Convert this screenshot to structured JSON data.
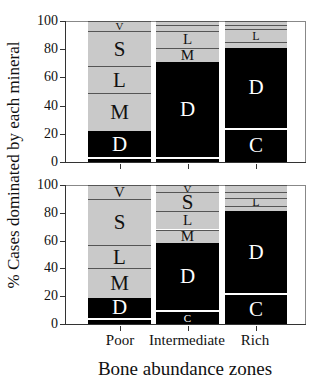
{
  "chart_data": [
    {
      "type": "bar",
      "stacked": true,
      "panel": "top",
      "categories": [
        "Poor",
        "Intermediate",
        "Rich"
      ],
      "ylabel": "% Cases dominated by each mineral",
      "xlabel": "Bone abundance zones",
      "ylim": [
        0,
        100
      ],
      "yticks": [
        0,
        20,
        40,
        60,
        80,
        100
      ],
      "segments_order": [
        "C",
        "D",
        "M",
        "L",
        "S",
        "V"
      ],
      "series": [
        {
          "name": "C",
          "values": [
            2,
            2,
            23
          ],
          "color": "#000000"
        },
        {
          "name": "D",
          "values": [
            20,
            69,
            58
          ],
          "color": "#000000"
        },
        {
          "name": "M",
          "values": [
            27,
            10,
            4
          ],
          "color": "#c9c9c9"
        },
        {
          "name": "L",
          "values": [
            19,
            12,
            9
          ],
          "color": "#c9c9c9"
        },
        {
          "name": "S",
          "values": [
            25,
            4,
            3
          ],
          "color": "#c9c9c9"
        },
        {
          "name": "V",
          "values": [
            7,
            3,
            3
          ],
          "color": "#c9c9c9"
        }
      ]
    },
    {
      "type": "bar",
      "stacked": true,
      "panel": "bottom",
      "categories": [
        "Poor",
        "Intermediate",
        "Rich"
      ],
      "ylabel": "% Cases dominated by each mineral",
      "xlabel": "Bone abundance zones",
      "ylim": [
        0,
        100
      ],
      "yticks": [
        0,
        20,
        40,
        60,
        80,
        100
      ],
      "segments_order": [
        "C",
        "D",
        "M",
        "L",
        "S",
        "V"
      ],
      "series": [
        {
          "name": "C",
          "values": [
            3,
            9,
            21
          ],
          "color": "#000000"
        },
        {
          "name": "D",
          "values": [
            16,
            49,
            60
          ],
          "color": "#000000"
        },
        {
          "name": "M",
          "values": [
            21,
            10,
            4
          ],
          "color": "#c9c9c9"
        },
        {
          "name": "L",
          "values": [
            17,
            13,
            6
          ],
          "color": "#c9c9c9"
        },
        {
          "name": "S",
          "values": [
            33,
            14,
            4
          ],
          "color": "#c9c9c9"
        },
        {
          "name": "V",
          "values": [
            10,
            5,
            5
          ],
          "color": "#c9c9c9"
        }
      ]
    }
  ],
  "labels": {
    "ylabel": "% Cases dominated by each mineral",
    "xlabel": "Bone abundance zones",
    "categories": [
      "Poor",
      "Intermediate",
      "Rich"
    ],
    "yticks": [
      "0",
      "20",
      "40",
      "60",
      "80",
      "100"
    ]
  }
}
